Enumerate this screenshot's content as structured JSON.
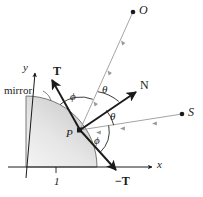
{
  "figure": {
    "background_color": "#ffffff",
    "ink_color": "#1a1a1a",
    "ray_color": "#9a9a9a",
    "mirror_fill_light": "#f2f2f2",
    "mirror_fill_dark": "#cfcfcf",
    "mirror_edge_color": "#555555"
  },
  "labels": {
    "mirror": "mirror",
    "axis_x": "x",
    "axis_y": "y",
    "radius_one": "1",
    "point_p": "P",
    "point_o": "O",
    "point_s": "S",
    "vector_t": "T",
    "vector_minus_t": "−T",
    "vector_n": "N",
    "angle_phi_upper": "ϕ",
    "angle_theta_upper": "θ",
    "angle_theta_lower": "θ",
    "angle_phi_lower": "ϕ"
  },
  "geometry": {
    "origin": {
      "x": 26,
      "y": 167
    },
    "mirror_radius": 71,
    "point_p": {
      "x": 79,
      "y": 130
    },
    "point_o": {
      "x": 134,
      "y": 12
    },
    "point_s": {
      "x": 182,
      "y": 114
    },
    "t_tip": {
      "x": 50,
      "y": 78
    },
    "minus_t_tip": {
      "x": 118,
      "y": 172
    },
    "n_tip": {
      "x": 138,
      "y": 90
    },
    "x_axis_tip": {
      "x": 155,
      "y": 167
    },
    "y_axis_tip": {
      "x": 35,
      "y": 70
    },
    "tick_one": {
      "x": 56,
      "y": 167
    }
  }
}
